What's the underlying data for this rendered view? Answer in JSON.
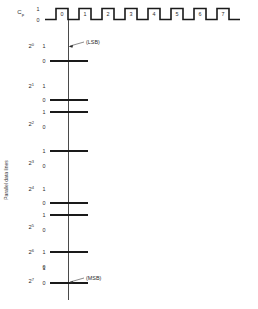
{
  "diagram": {
    "axis_label_vertical": "Parallel data lines",
    "clock": {
      "name": "C",
      "subscript": "p",
      "level_high": "1",
      "level_low": "0",
      "pulse_labels": [
        "0",
        "1",
        "2",
        "3",
        "4",
        "5",
        "6",
        "7"
      ],
      "pulse_count": 8
    },
    "annotations": {
      "lsb": "(LSB)",
      "msb": "(MSB)"
    },
    "data_lines": [
      {
        "power_base": "2",
        "power_exp": "0",
        "label_high": "1",
        "label_low": "0",
        "state": 0,
        "note": "(LSB)"
      },
      {
        "power_base": "2",
        "power_exp": "1",
        "label_high": "1",
        "label_low": "0",
        "state": 0,
        "note": ""
      },
      {
        "power_base": "2",
        "power_exp": "2",
        "label_high": "1",
        "label_low": "0",
        "state": 1,
        "note": ""
      },
      {
        "power_base": "2",
        "power_exp": "3",
        "label_high": "1",
        "label_low": "0",
        "state": 1,
        "note": ""
      },
      {
        "power_base": "2",
        "power_exp": "4",
        "label_high": "1",
        "label_low": "0",
        "state": 0,
        "note": ""
      },
      {
        "power_base": "2",
        "power_exp": "5",
        "label_high": "1",
        "label_low": "0",
        "state": 1,
        "note": ""
      },
      {
        "power_base": "2",
        "power_exp": "6",
        "label_high": "1",
        "label_low": "0",
        "state": 1,
        "note": ""
      },
      {
        "power_base": "2",
        "power_exp": "7",
        "label_high": "1",
        "label_low": "0",
        "state": 0,
        "note": "(MSB)"
      }
    ],
    "colors": {
      "signal": "#1a1a1a",
      "reference": "#4a4a4a",
      "text": "#2b2b2b",
      "background": "#ffffff"
    }
  }
}
